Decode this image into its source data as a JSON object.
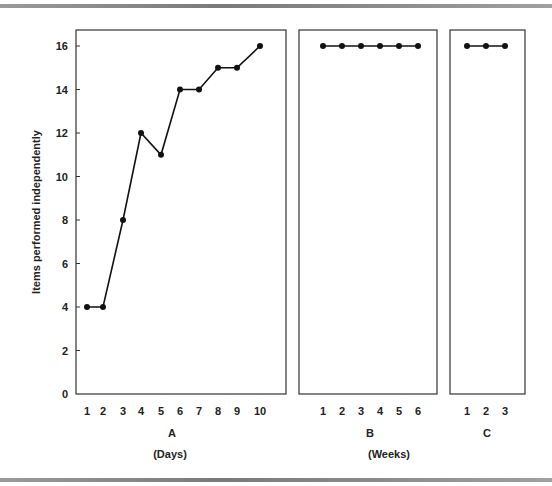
{
  "chart_data": {
    "type": "line",
    "ylabel": "Items performed independently",
    "ylim": [
      0,
      16
    ],
    "yticks": [
      0,
      2,
      4,
      6,
      8,
      10,
      12,
      14,
      16
    ],
    "grid": false,
    "legend": null,
    "panels": [
      {
        "id": "A",
        "label": "A",
        "unit_label": "(Days)",
        "x": [
          1,
          2,
          3,
          4,
          5,
          6,
          7,
          8,
          9,
          10
        ],
        "values": [
          4,
          4,
          8,
          12,
          11,
          14,
          14,
          15,
          15,
          16
        ]
      },
      {
        "id": "B",
        "label": "B",
        "unit_label": "(Weeks)",
        "x": [
          1,
          2,
          3,
          4,
          5,
          6
        ],
        "values": [
          16,
          16,
          16,
          16,
          16,
          16
        ]
      },
      {
        "id": "C",
        "label": "C",
        "unit_label": "",
        "x": [
          1,
          2,
          3
        ],
        "values": [
          16,
          16,
          16
        ]
      }
    ]
  },
  "labels": {
    "ylabel": "Items performed independently",
    "panel_a": "A",
    "panel_b": "B",
    "panel_c": "C",
    "days": "(Days)",
    "weeks": "(Weeks)"
  },
  "colors": {
    "line": "#111111",
    "frame": "#333333",
    "rule": "#8a8a8a"
  }
}
